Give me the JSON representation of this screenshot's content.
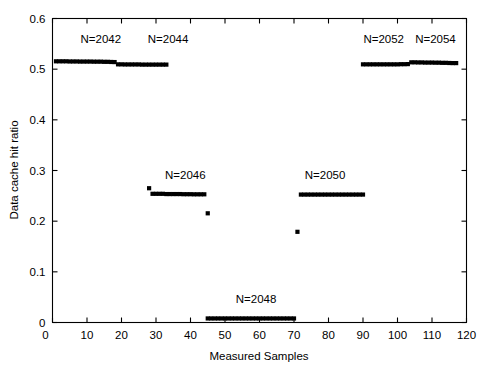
{
  "chart_data": {
    "type": "scatter",
    "title": "",
    "xlabel": "Measured Samples",
    "ylabel": "Data cache hit ratio",
    "xlim": [
      0,
      120
    ],
    "ylim": [
      0,
      0.6
    ],
    "xticks": [
      0,
      10,
      20,
      30,
      40,
      50,
      60,
      70,
      80,
      90,
      100,
      110,
      120
    ],
    "xticklabels": [
      "0",
      "10",
      "20",
      "30",
      "40",
      "50",
      "60",
      "70",
      "80",
      "90",
      "100",
      "110",
      "120"
    ],
    "yticks": [
      0,
      0.1,
      0.2,
      0.3,
      0.4,
      0.5,
      0.6
    ],
    "yticklabels": [
      "0",
      "0.1",
      "0.2",
      "0.3",
      "0.4",
      "0.5",
      "0.6"
    ],
    "grid": false,
    "legend": "none",
    "marker": "square",
    "marker_color": "#000000",
    "marker_size": 2.1,
    "series": [
      {
        "name": "N=2042",
        "label": "N=2042",
        "label_x": 14,
        "label_y": 0.552,
        "x": [
          1,
          2,
          3,
          4,
          5,
          6,
          7,
          8,
          9,
          10,
          11,
          12,
          13,
          14,
          15,
          16,
          17,
          18
        ],
        "values": [
          0.5155,
          0.5155,
          0.5155,
          0.5155,
          0.5152,
          0.5152,
          0.5152,
          0.515,
          0.515,
          0.515,
          0.515,
          0.5148,
          0.5148,
          0.5148,
          0.5145,
          0.5145,
          0.5142,
          0.514
        ]
      },
      {
        "name": "N=2044",
        "label": "N=2044",
        "label_x": 33.5,
        "label_y": 0.552,
        "x": [
          19,
          20,
          21,
          22,
          23,
          24,
          25,
          26,
          27,
          28,
          29,
          30,
          31,
          32,
          33
        ],
        "values": [
          0.5095,
          0.5095,
          0.5093,
          0.5093,
          0.5093,
          0.5093,
          0.5093,
          0.509,
          0.509,
          0.509,
          0.509,
          0.509,
          0.509,
          0.509,
          0.509
        ]
      },
      {
        "name": "N=2046",
        "label": "N=2046",
        "label_x": 38.5,
        "label_y": 0.283,
        "x": [
          28,
          29,
          30,
          31,
          32,
          33,
          34,
          35,
          36,
          37,
          38,
          39,
          40,
          41,
          42,
          43,
          44
        ],
        "values": [
          0.265,
          0.254,
          0.254,
          0.254,
          0.254,
          0.2535,
          0.2535,
          0.2535,
          0.2535,
          0.2535,
          0.2532,
          0.2532,
          0.2532,
          0.253,
          0.253,
          0.253,
          0.253
        ]
      },
      {
        "name": "N=2046-transition",
        "label": "",
        "label_x": 0,
        "label_y": 0,
        "x": [
          45
        ],
        "values": [
          0.2155
        ]
      },
      {
        "name": "N=2048",
        "label": "N=2048",
        "label_x": 59,
        "label_y": 0.038,
        "x": [
          45,
          46,
          47,
          48,
          49,
          50,
          51,
          52,
          53,
          54,
          55,
          56,
          57,
          58,
          59,
          60,
          61,
          62,
          63,
          64,
          65,
          66,
          67,
          68,
          69,
          70
        ],
        "values": [
          0.008,
          0.008,
          0.008,
          0.008,
          0.008,
          0.008,
          0.008,
          0.008,
          0.008,
          0.008,
          0.008,
          0.008,
          0.008,
          0.008,
          0.008,
          0.008,
          0.008,
          0.008,
          0.008,
          0.008,
          0.008,
          0.008,
          0.008,
          0.008,
          0.008,
          0.008
        ]
      },
      {
        "name": "N=2050-transition",
        "label": "",
        "label_x": 0,
        "label_y": 0,
        "x": [
          71
        ],
        "values": [
          0.179
        ]
      },
      {
        "name": "N=2050",
        "label": "N=2050",
        "label_x": 79,
        "label_y": 0.283,
        "x": [
          72,
          73,
          74,
          75,
          76,
          77,
          78,
          79,
          80,
          81,
          82,
          83,
          84,
          85,
          86,
          87,
          88,
          89,
          90
        ],
        "values": [
          0.2525,
          0.2525,
          0.2525,
          0.2525,
          0.2525,
          0.2525,
          0.2525,
          0.2525,
          0.2525,
          0.2525,
          0.2525,
          0.2525,
          0.2525,
          0.2525,
          0.2525,
          0.2525,
          0.2525,
          0.2525,
          0.2525
        ]
      },
      {
        "name": "N=2052",
        "label": "N=2052",
        "label_x": 96,
        "label_y": 0.552,
        "x": [
          90,
          91,
          92,
          93,
          94,
          95,
          96,
          97,
          98,
          99,
          100,
          101,
          102,
          103
        ],
        "values": [
          0.5095,
          0.5095,
          0.5095,
          0.5095,
          0.5095,
          0.5095,
          0.5095,
          0.5095,
          0.5095,
          0.5095,
          0.5095,
          0.5098,
          0.5098,
          0.51
        ]
      },
      {
        "name": "N=2054",
        "label": "N=2054",
        "label_x": 111,
        "label_y": 0.552,
        "x": [
          104,
          105,
          106,
          107,
          108,
          109,
          110,
          111,
          112,
          113,
          114,
          115,
          116,
          117
        ],
        "values": [
          0.5135,
          0.5135,
          0.5133,
          0.5133,
          0.513,
          0.513,
          0.513,
          0.5128,
          0.5128,
          0.5125,
          0.5125,
          0.5122,
          0.512,
          0.512
        ]
      }
    ]
  }
}
